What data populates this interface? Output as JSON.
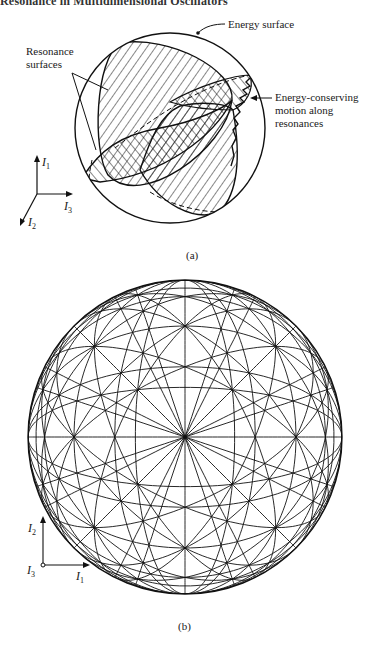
{
  "header": {
    "text": "Resonance in Multidimensional Oscillators"
  },
  "figure_a": {
    "caption": "(a)",
    "labels": {
      "energy_surface": "Energy surface",
      "resonance_surfaces": [
        "Resonance",
        "surfaces"
      ],
      "energy_conserving": [
        "Energy-conserving",
        "motion along",
        "resonances"
      ]
    },
    "axes": {
      "up": {
        "name": "I",
        "sub": "1"
      },
      "right": {
        "name": "I",
        "sub": "3"
      },
      "diag": {
        "name": "I",
        "sub": "2"
      }
    },
    "circle": {
      "cx": 170,
      "cy": 128,
      "r": 95
    }
  },
  "figure_b": {
    "caption": "(b)",
    "axes": {
      "up": {
        "name": "I",
        "sub": "2"
      },
      "right": {
        "name": "I",
        "sub": "1"
      },
      "origin": {
        "name": "I",
        "sub": "3"
      }
    },
    "sphere": {
      "cx": 185,
      "cy": 437,
      "r": 157
    }
  },
  "colors": {
    "ink": "#111111",
    "paper": "#ffffff"
  }
}
